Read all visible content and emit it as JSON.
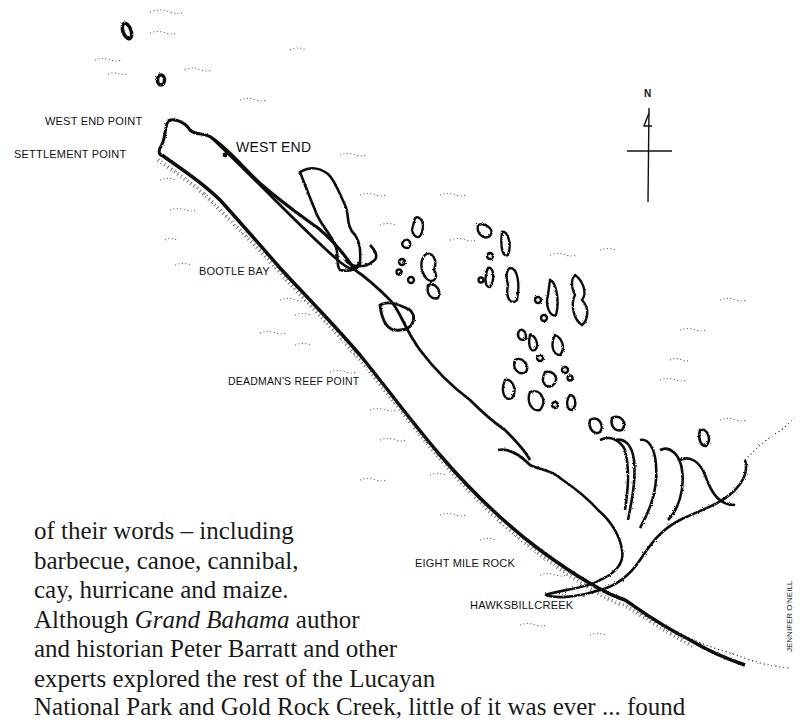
{
  "map": {
    "labels": {
      "west_end_point": "WEST END POINT",
      "settlement_point": "SETTLEMENT POINT",
      "west_end": "WEST END",
      "bootle_bay": "BOOTLE BAY",
      "deadmans_reef_point": "DEADMAN'S REEF POINT",
      "eight_mile_rock": "EIGHT MILE ROCK",
      "hawksbill_creek": "HAWKSBILLCREEK"
    },
    "compass": {
      "north_label": "N"
    },
    "credit": "JENNIFER O'NEILL",
    "colors": {
      "ink": "#111111",
      "paper": "#ffffff"
    }
  },
  "body_text": {
    "lines": [
      "of their words – including",
      "barbecue, canoe, cannibal,",
      "cay, hurricane and maize.",
      "Although ",
      "and historian Peter Barratt and other",
      "experts explored the rest of the Lucayan",
      "National Park and Gold Rock Creek, little of it was ever ... found"
    ],
    "line4_italic": "Grand Bahama",
    "line4_suffix": " author"
  }
}
